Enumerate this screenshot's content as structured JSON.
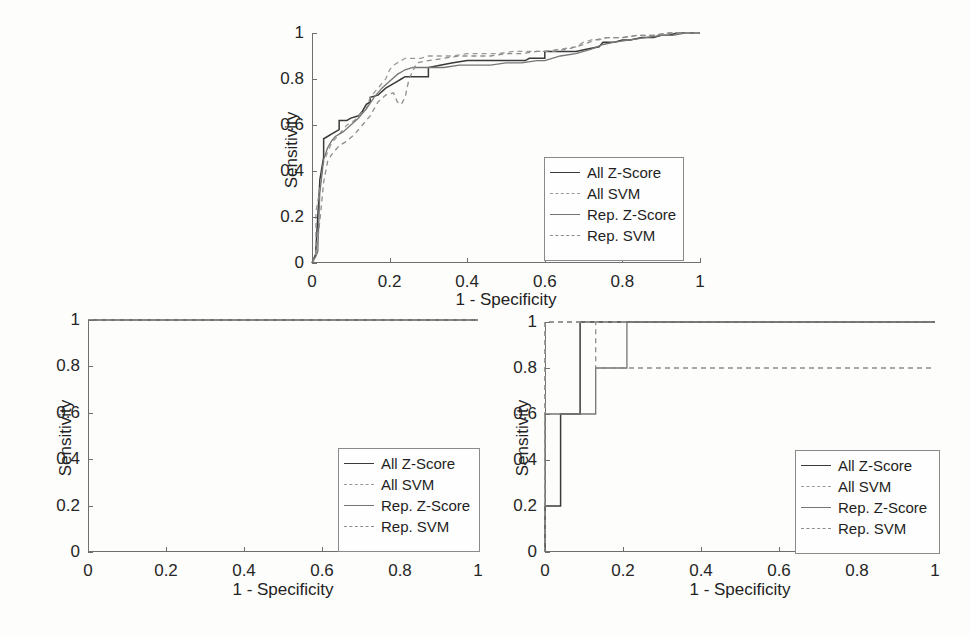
{
  "figure": {
    "background": "#fdfdfc",
    "axis_color": "#6f6f6f",
    "panel_count": 3
  },
  "series_style": {
    "all_zscore": {
      "color": "#3a3a3a",
      "dash": "none",
      "width": 1.5
    },
    "all_svm": {
      "color": "#9a9a9a",
      "dash": "5,4",
      "width": 1.3
    },
    "rep_zscore": {
      "color": "#757575",
      "dash": "none",
      "width": 1.3
    },
    "rep_svm": {
      "color": "#8d8d8d",
      "dash": "5,4",
      "width": 1.3
    }
  },
  "legend": {
    "entries": [
      {
        "label": "All Z-Score",
        "style": "solid"
      },
      {
        "label": "All SVM",
        "style": "dashed"
      },
      {
        "label": "Rep. Z-Score",
        "style": "solid"
      },
      {
        "label": "Rep. SVM",
        "style": "dashed"
      }
    ]
  },
  "axes": {
    "xlabel": "1 - Specificity",
    "ylabel": "Sensitivity",
    "xticks": [
      "0",
      "0.2",
      "0.4",
      "0.6",
      "0.8",
      "1"
    ],
    "yticks": [
      "0",
      "0.2",
      "0.4",
      "0.6",
      "0.8",
      "1"
    ],
    "xlim": [
      0,
      1
    ],
    "ylim": [
      0,
      1
    ]
  },
  "chart_data": [
    {
      "type": "line",
      "panel": "top",
      "title": "",
      "xlabel": "1 - Specificity",
      "ylabel": "Sensitivity",
      "xlim": [
        0,
        1
      ],
      "ylim": [
        0,
        1
      ],
      "grid": false,
      "legend_position": "lower-right",
      "series": [
        {
          "name": "All Z-Score",
          "x": [
            0,
            0.005,
            0.01,
            0.01,
            0.02,
            0.02,
            0.03,
            0.03,
            0.04,
            0.05,
            0.06,
            0.07,
            0.07,
            0.09,
            0.1,
            0.12,
            0.13,
            0.14,
            0.15,
            0.15,
            0.17,
            0.19,
            0.21,
            0.22,
            0.23,
            0.24,
            0.26,
            0.28,
            0.3,
            0.3,
            0.33,
            0.36,
            0.4,
            0.44,
            0.48,
            0.52,
            0.55,
            0.56,
            0.6,
            0.6,
            0.64,
            0.68,
            0.71,
            0.74,
            0.75,
            0.78,
            0.8,
            0.82,
            0.85,
            0.88,
            0.9,
            0.92,
            0.94,
            0.96,
            1.0
          ],
          "y": [
            0,
            0.02,
            0.04,
            0.06,
            0.35,
            0.36,
            0.46,
            0.54,
            0.55,
            0.56,
            0.57,
            0.58,
            0.62,
            0.62,
            0.63,
            0.64,
            0.66,
            0.69,
            0.7,
            0.72,
            0.73,
            0.76,
            0.78,
            0.79,
            0.8,
            0.81,
            0.81,
            0.81,
            0.81,
            0.85,
            0.86,
            0.87,
            0.88,
            0.88,
            0.88,
            0.88,
            0.88,
            0.89,
            0.89,
            0.92,
            0.92,
            0.92,
            0.93,
            0.94,
            0.96,
            0.96,
            0.97,
            0.97,
            0.98,
            0.98,
            0.99,
            0.99,
            1.0,
            1.0,
            1.0
          ]
        },
        {
          "name": "All SVM",
          "x": [
            0,
            0.01,
            0.01,
            0.02,
            0.03,
            0.04,
            0.05,
            0.06,
            0.07,
            0.08,
            0.09,
            0.11,
            0.12,
            0.14,
            0.15,
            0.17,
            0.19,
            0.2,
            0.21,
            0.22,
            0.23,
            0.24,
            0.25,
            0.26,
            0.28,
            0.3,
            0.33,
            0.36,
            0.4,
            0.44,
            0.48,
            0.52,
            0.56,
            0.6,
            0.64,
            0.68,
            0.7,
            0.72,
            0.74,
            0.76,
            0.8,
            0.84,
            0.88,
            0.92,
            0.95,
            1.0
          ],
          "y": [
            0,
            0.03,
            0.22,
            0.32,
            0.44,
            0.48,
            0.52,
            0.54,
            0.56,
            0.58,
            0.6,
            0.62,
            0.64,
            0.67,
            0.72,
            0.76,
            0.8,
            0.84,
            0.86,
            0.87,
            0.88,
            0.89,
            0.89,
            0.89,
            0.89,
            0.9,
            0.9,
            0.9,
            0.91,
            0.91,
            0.91,
            0.92,
            0.92,
            0.92,
            0.93,
            0.94,
            0.96,
            0.97,
            0.97,
            0.98,
            0.98,
            0.99,
            0.99,
            1.0,
            1.0,
            1.0
          ]
        },
        {
          "name": "Rep. Z-Score",
          "x": [
            0,
            0.01,
            0.015,
            0.02,
            0.03,
            0.04,
            0.05,
            0.06,
            0.08,
            0.1,
            0.12,
            0.14,
            0.16,
            0.18,
            0.2,
            0.22,
            0.24,
            0.26,
            0.28,
            0.3,
            0.34,
            0.38,
            0.42,
            0.46,
            0.5,
            0.54,
            0.58,
            0.6,
            0.64,
            0.68,
            0.72,
            0.75,
            0.78,
            0.82,
            0.86,
            0.9,
            0.93,
            0.96,
            1.0
          ],
          "y": [
            0,
            0.03,
            0.05,
            0.3,
            0.45,
            0.5,
            0.53,
            0.55,
            0.57,
            0.6,
            0.63,
            0.67,
            0.72,
            0.76,
            0.79,
            0.82,
            0.84,
            0.85,
            0.85,
            0.85,
            0.85,
            0.86,
            0.86,
            0.86,
            0.87,
            0.87,
            0.88,
            0.88,
            0.9,
            0.91,
            0.93,
            0.95,
            0.96,
            0.97,
            0.98,
            0.99,
            0.99,
            1.0,
            1.0
          ]
        },
        {
          "name": "Rep. SVM",
          "x": [
            0,
            0.01,
            0.02,
            0.03,
            0.04,
            0.05,
            0.07,
            0.09,
            0.11,
            0.13,
            0.15,
            0.17,
            0.19,
            0.21,
            0.22,
            0.23,
            0.24,
            0.25,
            0.27,
            0.3,
            0.34,
            0.38,
            0.42,
            0.46,
            0.5,
            0.54,
            0.58,
            0.62,
            0.66,
            0.7,
            0.73,
            0.76,
            0.8,
            0.84,
            0.88,
            0.92,
            0.95,
            1.0
          ],
          "y": [
            0,
            0.03,
            0.18,
            0.35,
            0.44,
            0.47,
            0.51,
            0.53,
            0.56,
            0.6,
            0.64,
            0.7,
            0.73,
            0.74,
            0.7,
            0.69,
            0.72,
            0.8,
            0.87,
            0.88,
            0.89,
            0.9,
            0.9,
            0.9,
            0.91,
            0.91,
            0.92,
            0.92,
            0.93,
            0.95,
            0.97,
            0.98,
            0.98,
            0.99,
            0.99,
            1.0,
            1.0,
            1.0
          ]
        }
      ]
    },
    {
      "type": "line",
      "panel": "bottom-left",
      "title": "",
      "xlabel": "1 - Specificity",
      "ylabel": "Sensitivity",
      "xlim": [
        0,
        1
      ],
      "ylim": [
        0,
        1
      ],
      "grid": false,
      "legend_position": "lower-right",
      "note": "All four curves are perfect classifiers: sensitivity = 1 across the full range of 1 - specificity",
      "series": [
        {
          "name": "All Z-Score",
          "x": [
            0,
            1
          ],
          "y": [
            1,
            1
          ]
        },
        {
          "name": "All SVM",
          "x": [
            0,
            1
          ],
          "y": [
            1,
            1
          ]
        },
        {
          "name": "Rep. Z-Score",
          "x": [
            0,
            1
          ],
          "y": [
            1,
            1
          ]
        },
        {
          "name": "Rep. SVM",
          "x": [
            0,
            1
          ],
          "y": [
            1,
            1
          ]
        }
      ]
    },
    {
      "type": "line",
      "panel": "bottom-right",
      "title": "",
      "xlabel": "1 - Specificity",
      "ylabel": "Sensitivity",
      "xlim": [
        0,
        1
      ],
      "ylim": [
        0,
        1
      ],
      "grid": false,
      "legend_position": "lower-right",
      "note": "Coarse step curves from a small test set; SVM curves rise to 1 immediately",
      "series": [
        {
          "name": "All Z-Score",
          "x": [
            0,
            0,
            0.04,
            0.04,
            0.09,
            0.09,
            0.21,
            0.21,
            1.0
          ],
          "y": [
            0,
            0.2,
            0.2,
            0.6,
            0.6,
            1.0,
            1.0,
            1.0,
            1.0
          ]
        },
        {
          "name": "All SVM",
          "x": [
            0,
            0,
            1.0
          ],
          "y": [
            0,
            1.0,
            1.0
          ]
        },
        {
          "name": "Rep. Z-Score",
          "x": [
            0,
            0,
            0.04,
            0.04,
            0.13,
            0.13,
            0.21,
            0.21,
            1.0
          ],
          "y": [
            0,
            0.6,
            0.6,
            0.6,
            0.6,
            0.8,
            0.8,
            1.0,
            1.0
          ]
        },
        {
          "name": "Rep. SVM",
          "x": [
            0,
            0,
            0.13,
            0.13,
            1.0
          ],
          "y": [
            0,
            1.0,
            1.0,
            0.8,
            0.8
          ]
        }
      ]
    }
  ]
}
